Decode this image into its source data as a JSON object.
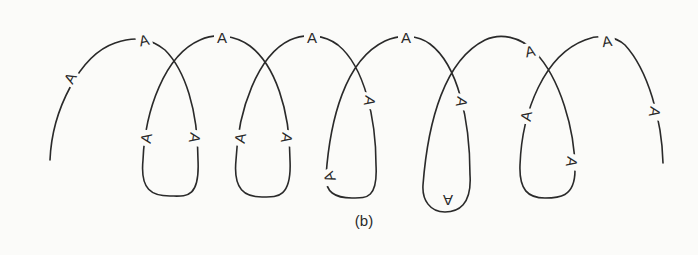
{
  "figure": {
    "caption": "(b)",
    "stroke_color": "#2a2a2a",
    "background_color": "#fbfbf9",
    "marks": [
      {
        "label": "A",
        "x": 70,
        "y": 78,
        "rotate": -62
      },
      {
        "label": "A",
        "x": 144,
        "y": 40,
        "rotate": -12
      },
      {
        "label": "A",
        "x": 195,
        "y": 138,
        "rotate": 100
      },
      {
        "label": "A",
        "x": 146,
        "y": 138,
        "rotate": -80
      },
      {
        "label": "A",
        "x": 222,
        "y": 37,
        "rotate": 0
      },
      {
        "label": "A",
        "x": 287,
        "y": 138,
        "rotate": 100
      },
      {
        "label": "A",
        "x": 240,
        "y": 138,
        "rotate": -80
      },
      {
        "label": "A",
        "x": 312,
        "y": 37,
        "rotate": 0
      },
      {
        "label": "A",
        "x": 370,
        "y": 101,
        "rotate": 100
      },
      {
        "label": "A",
        "x": 329,
        "y": 177,
        "rotate": -110
      },
      {
        "label": "A",
        "x": 406,
        "y": 37,
        "rotate": 0
      },
      {
        "label": "A",
        "x": 462,
        "y": 102,
        "rotate": 100
      },
      {
        "label": "A",
        "x": 448,
        "y": 200,
        "rotate": 180
      },
      {
        "label": "A",
        "x": 530,
        "y": 51,
        "rotate": -12
      },
      {
        "label": "A",
        "x": 572,
        "y": 162,
        "rotate": 100
      },
      {
        "label": "A",
        "x": 526,
        "y": 116,
        "rotate": -80
      },
      {
        "label": "A",
        "x": 607,
        "y": 41,
        "rotate": -8
      },
      {
        "label": "A",
        "x": 655,
        "y": 112,
        "rotate": 100
      }
    ]
  }
}
